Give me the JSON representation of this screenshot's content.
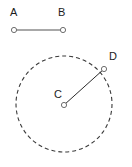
{
  "figure": {
    "title": "",
    "background_color": "#ffffff",
    "width": 132,
    "height": 167,
    "labels": {
      "A": "A",
      "B": "B",
      "C": "C",
      "D": "D"
    },
    "colors": {
      "segment_stroke": "#8c8c8c",
      "radius_stroke": "#2b2b2b",
      "circle_stroke": "#3a3a3a",
      "marker_stroke": "#6e6e6e",
      "marker_fill": "#ffffff",
      "label_color": "#1c1c1c"
    },
    "segment_ab": {
      "name": "segment AB",
      "x1": 14,
      "y1": 30,
      "x2": 63,
      "y2": 30,
      "stroke_width": 1.4,
      "length_px": 49
    },
    "circle": {
      "name": "dashed circle centered at C",
      "cx": 64,
      "cy": 104,
      "r": 48,
      "stroke_width": 1.1,
      "dash": "4 3",
      "style": "dashed"
    },
    "radius_cd": {
      "name": "radius CD",
      "x1": 64,
      "y1": 105,
      "x2": 104,
      "y2": 69,
      "stroke_width": 1,
      "length_px": 54
    },
    "points": [
      {
        "id": "A",
        "cx": 14,
        "cy": 30,
        "r": 2.6
      },
      {
        "id": "B",
        "cx": 63,
        "cy": 30,
        "r": 2.6
      },
      {
        "id": "C",
        "cx": 64,
        "cy": 105,
        "r": 2.6
      },
      {
        "id": "D",
        "cx": 104,
        "cy": 69,
        "r": 2.6
      }
    ]
  }
}
